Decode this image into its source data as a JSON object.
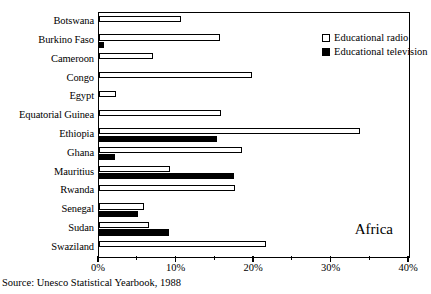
{
  "chart_data": {
    "type": "bar",
    "orientation": "horizontal",
    "title": "",
    "subtitle": "",
    "xlabel": "",
    "ylabel": "",
    "xlim": [
      0,
      40
    ],
    "xtick_labels": [
      "0%",
      "10%",
      "20%",
      "30%",
      "40%"
    ],
    "xtick_values": [
      0,
      10,
      20,
      30,
      40
    ],
    "xminor_values": [
      5,
      15,
      25,
      35
    ],
    "grid": false,
    "legend_position": "top-right",
    "annotation": "Africa",
    "source": "Source: Unesco Statistical Yearbook, 1988",
    "categories": [
      "Botswana",
      "Burkino Faso",
      "Cameroon",
      "Congo",
      "Egypt",
      "Equatorial Guinea",
      "Ethiopia",
      "Ghana",
      "Mauritius",
      "Rwanda",
      "Senegal",
      "Sudan",
      "Swaziland"
    ],
    "series": [
      {
        "name": "Educational radio",
        "color": "#ffffff",
        "edge_color": "#000000",
        "values": [
          10.6,
          15.6,
          7.0,
          19.7,
          2.2,
          15.7,
          33.7,
          18.4,
          9.1,
          17.5,
          5.8,
          6.4,
          21.5
        ]
      },
      {
        "name": "Educational television",
        "color": "#000000",
        "edge_color": "#000000",
        "values": [
          0,
          0.7,
          0,
          0,
          0,
          0,
          15.2,
          2.1,
          17.4,
          0,
          5.0,
          9.0,
          0
        ]
      }
    ]
  },
  "legend": {
    "items": [
      {
        "label": "Educational radio",
        "style": "radio"
      },
      {
        "label": "Educational television",
        "style": "tv"
      }
    ]
  }
}
